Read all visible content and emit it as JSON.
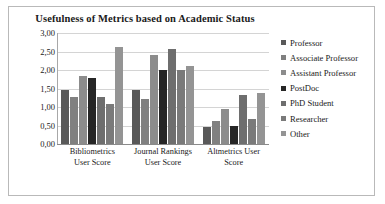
{
  "chart_data": {
    "type": "bar",
    "title": "Usefulness of Metrics based on Academic Status",
    "xlabel": "",
    "ylabel": "",
    "ylim": [
      0,
      3
    ],
    "ytick_labels": [
      "3,00",
      "2,50",
      "2,00",
      "1,50",
      "1,00",
      "0,50",
      "0,00"
    ],
    "ytick_values": [
      3.0,
      2.5,
      2.0,
      1.5,
      1.0,
      0.5,
      0.0
    ],
    "grid": true,
    "legend_position": "right",
    "categories": [
      "Bibliometrics User Score",
      "Journal Rankings User Score",
      "Altmetrics User Score"
    ],
    "category_lines": [
      [
        "Bibliometrics",
        "User Score"
      ],
      [
        "Journal Rankings",
        "User Score"
      ],
      [
        "Altmetrics User",
        "Score"
      ]
    ],
    "series": [
      {
        "name": "Professor",
        "color": "#595959",
        "values": [
          1.45,
          1.45,
          0.46
        ]
      },
      {
        "name": "Associate Professor",
        "color": "#808080",
        "values": [
          1.28,
          1.22,
          0.61
        ]
      },
      {
        "name": "Assistant Professor",
        "color": "#8c8c8c",
        "values": [
          1.83,
          2.4,
          0.94
        ]
      },
      {
        "name": "PostDoc",
        "color": "#262626",
        "values": [
          1.79,
          2.0,
          0.49
        ]
      },
      {
        "name": "PhD Student",
        "color": "#6e6e6e",
        "values": [
          1.26,
          2.58,
          1.32
        ]
      },
      {
        "name": "Researcher",
        "color": "#7a7a7a",
        "values": [
          1.07,
          2.0,
          0.67
        ]
      },
      {
        "name": "Other",
        "color": "#949494",
        "values": [
          2.61,
          2.12,
          1.37
        ]
      }
    ]
  }
}
